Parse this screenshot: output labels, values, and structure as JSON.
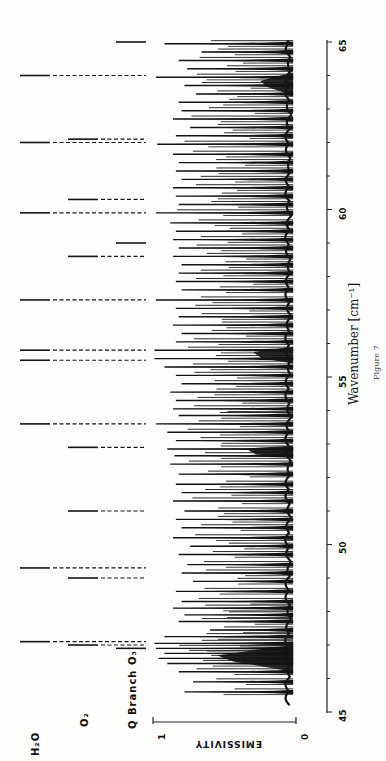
{
  "figure": {
    "caption": "Figure 7",
    "x_axis_label": "Wavenumber [cm⁻¹]",
    "y_axis_label": "EMISSIVITY",
    "y_axis_ticks": [
      "1",
      "0"
    ],
    "x_axis_ticks": [
      "45",
      "50",
      "55",
      "60",
      "65"
    ],
    "legend_rows": [
      {
        "id": "h2o",
        "label": "H₂O"
      },
      {
        "id": "o2",
        "label": "O₂"
      },
      {
        "id": "q",
        "label": "Q Branch O₃"
      }
    ]
  },
  "chart_data": {
    "type": "line",
    "title": "",
    "caption": "Figure 7",
    "xlabel": "Wavenumber [cm⁻¹]",
    "ylabel": "EMISSIVITY",
    "xlim": [
      45,
      65
    ],
    "ylim": [
      0,
      1
    ],
    "x_ticks": [
      45,
      50,
      55,
      60,
      65
    ],
    "y_ticks": [
      0,
      1
    ],
    "orientation": "rotated 90° (wavenumber runs bottom-to-top, emissivity increases right-to-left)",
    "grid": false,
    "line_markers": {
      "H2O": [
        47.1,
        49.3,
        53.6,
        55.5,
        55.8,
        57.3,
        59.9,
        62.0,
        64.0
      ],
      "O2": [
        47.0,
        49.0,
        51.0,
        52.9,
        58.6,
        60.3,
        62.1
      ],
      "Q_Branch_O3": [
        46.9,
        59.0,
        65.0
      ]
    },
    "spectrum_peaks": [
      {
        "x": 45.6,
        "y": 0.78
      },
      {
        "x": 45.9,
        "y": 0.72
      },
      {
        "x": 46.2,
        "y": 0.82
      },
      {
        "x": 46.45,
        "y": 0.9
      },
      {
        "x": 46.6,
        "y": 0.96
      },
      {
        "x": 46.75,
        "y": 0.92
      },
      {
        "x": 46.9,
        "y": 0.98
      },
      {
        "x": 47.05,
        "y": 0.99
      },
      {
        "x": 47.25,
        "y": 0.92
      },
      {
        "x": 47.45,
        "y": 0.6
      },
      {
        "x": 47.7,
        "y": 0.82
      },
      {
        "x": 47.9,
        "y": 0.78
      },
      {
        "x": 48.1,
        "y": 0.86
      },
      {
        "x": 48.3,
        "y": 0.8
      },
      {
        "x": 48.6,
        "y": 0.84
      },
      {
        "x": 48.9,
        "y": 0.72
      },
      {
        "x": 49.15,
        "y": 0.8
      },
      {
        "x": 49.4,
        "y": 0.76
      },
      {
        "x": 49.7,
        "y": 0.82
      },
      {
        "x": 49.95,
        "y": 0.74
      },
      {
        "x": 50.2,
        "y": 0.86
      },
      {
        "x": 50.5,
        "y": 0.8
      },
      {
        "x": 50.75,
        "y": 0.84
      },
      {
        "x": 51.0,
        "y": 0.78
      },
      {
        "x": 51.3,
        "y": 0.86
      },
      {
        "x": 51.55,
        "y": 0.8
      },
      {
        "x": 51.8,
        "y": 0.84
      },
      {
        "x": 52.1,
        "y": 0.82
      },
      {
        "x": 52.4,
        "y": 0.88
      },
      {
        "x": 52.65,
        "y": 0.85
      },
      {
        "x": 52.85,
        "y": 0.9
      },
      {
        "x": 53.1,
        "y": 0.84
      },
      {
        "x": 53.35,
        "y": 0.9
      },
      {
        "x": 53.6,
        "y": 0.98
      },
      {
        "x": 53.85,
        "y": 0.82
      },
      {
        "x": 54.05,
        "y": 0.86
      },
      {
        "x": 54.3,
        "y": 0.84
      },
      {
        "x": 54.55,
        "y": 0.88
      },
      {
        "x": 54.8,
        "y": 0.8
      },
      {
        "x": 55.05,
        "y": 0.84
      },
      {
        "x": 55.3,
        "y": 0.92
      },
      {
        "x": 55.55,
        "y": 0.99
      },
      {
        "x": 55.8,
        "y": 0.99
      },
      {
        "x": 56.05,
        "y": 0.84
      },
      {
        "x": 56.3,
        "y": 0.8
      },
      {
        "x": 56.55,
        "y": 0.86
      },
      {
        "x": 56.8,
        "y": 0.82
      },
      {
        "x": 57.05,
        "y": 0.84
      },
      {
        "x": 57.3,
        "y": 0.98
      },
      {
        "x": 57.6,
        "y": 0.8
      },
      {
        "x": 57.85,
        "y": 0.84
      },
      {
        "x": 58.1,
        "y": 0.82
      },
      {
        "x": 58.35,
        "y": 0.8
      },
      {
        "x": 58.6,
        "y": 0.86
      },
      {
        "x": 58.85,
        "y": 0.82
      },
      {
        "x": 59.1,
        "y": 0.86
      },
      {
        "x": 59.35,
        "y": 0.84
      },
      {
        "x": 59.6,
        "y": 0.88
      },
      {
        "x": 59.9,
        "y": 0.98
      },
      {
        "x": 60.15,
        "y": 0.82
      },
      {
        "x": 60.4,
        "y": 0.84
      },
      {
        "x": 60.65,
        "y": 0.86
      },
      {
        "x": 60.9,
        "y": 0.8
      },
      {
        "x": 61.15,
        "y": 0.84
      },
      {
        "x": 61.4,
        "y": 0.82
      },
      {
        "x": 61.65,
        "y": 0.86
      },
      {
        "x": 61.95,
        "y": 0.97
      },
      {
        "x": 62.2,
        "y": 0.84
      },
      {
        "x": 62.45,
        "y": 0.74
      },
      {
        "x": 62.7,
        "y": 0.86
      },
      {
        "x": 62.95,
        "y": 0.8
      },
      {
        "x": 63.2,
        "y": 0.82
      },
      {
        "x": 63.45,
        "y": 0.7
      },
      {
        "x": 63.7,
        "y": 0.78
      },
      {
        "x": 63.95,
        "y": 0.98
      },
      {
        "x": 64.2,
        "y": 0.76
      },
      {
        "x": 64.45,
        "y": 0.82
      },
      {
        "x": 64.7,
        "y": 0.66
      },
      {
        "x": 64.95,
        "y": 0.92
      }
    ]
  },
  "layout": {
    "y_of_45": 712,
    "px_per_cm": 33.5,
    "x_of_emis_0": 296,
    "x_of_emis_1": 153,
    "marker_cols": {
      "H2O": {
        "solid_start": 20,
        "solid_end": 50,
        "dash_end": 146
      },
      "O2": {
        "solid_start": 68,
        "solid_end": 98,
        "dash_end": 146
      },
      "Q_Branch_O3": {
        "solid_start": 116,
        "solid_end": 146,
        "dash_end": 146
      }
    },
    "ink": "#141414"
  }
}
